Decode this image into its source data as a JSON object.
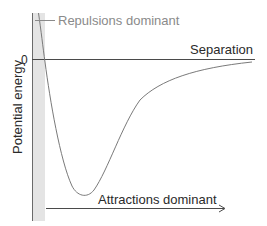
{
  "diagram": {
    "y_axis_label": "Potential energy",
    "zero_label": "0",
    "x_axis_label": "Separation",
    "repulsion_label": "Repulsions dominant",
    "attraction_label": "Attractions dominant",
    "colors": {
      "curve": "#7a7a7a",
      "axis": "#4a4a4a",
      "shaded_region": "#e4e4e4",
      "repulsion_text": "#8a8a8a",
      "text": "#2a2a2a"
    }
  }
}
